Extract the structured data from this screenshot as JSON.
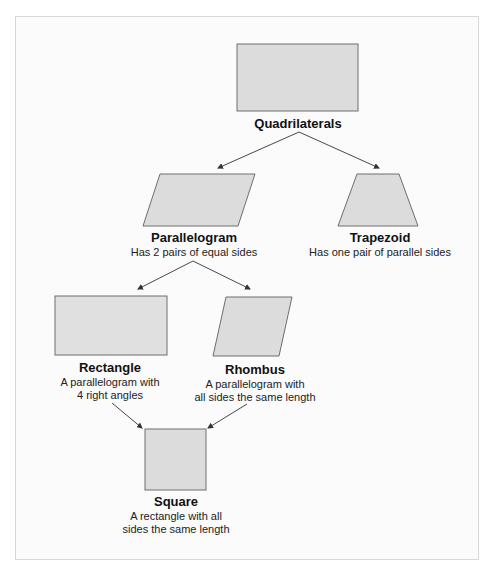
{
  "diagram": {
    "colors": {
      "frame_bg": "#fbfbfb",
      "frame_border": "#d8d8d8",
      "shape_fill": "#dcdcdc",
      "shape_stroke": "#6e6e6e",
      "arrow": "#333333"
    },
    "nodes": [
      {
        "id": "quadrilaterals",
        "shape": "rectangle",
        "title": "Quadrilaterals",
        "description": ""
      },
      {
        "id": "parallelogram",
        "shape": "parallelogram",
        "title": "Parallelogram",
        "description": "Has 2 pairs of equal sides"
      },
      {
        "id": "trapezoid",
        "shape": "trapezoid",
        "title": "Trapezoid",
        "description": "Has one pair of parallel sides"
      },
      {
        "id": "rectangle",
        "shape": "rectangle",
        "title": "Rectangle",
        "description_lines": [
          "A parallelogram with",
          "4 right angles"
        ]
      },
      {
        "id": "rhombus",
        "shape": "rhombus",
        "title": "Rhombus",
        "description_lines": [
          "A parallelogram with",
          "all sides the same length"
        ]
      },
      {
        "id": "square",
        "shape": "square",
        "title": "Square",
        "description_lines": [
          "A rectangle with all",
          "sides the same length"
        ]
      }
    ],
    "edges": [
      {
        "from": "quadrilaterals",
        "to": "parallelogram"
      },
      {
        "from": "quadrilaterals",
        "to": "trapezoid"
      },
      {
        "from": "parallelogram",
        "to": "rectangle"
      },
      {
        "from": "parallelogram",
        "to": "rhombus"
      },
      {
        "from": "rectangle",
        "to": "square"
      },
      {
        "from": "rhombus",
        "to": "square"
      }
    ]
  }
}
